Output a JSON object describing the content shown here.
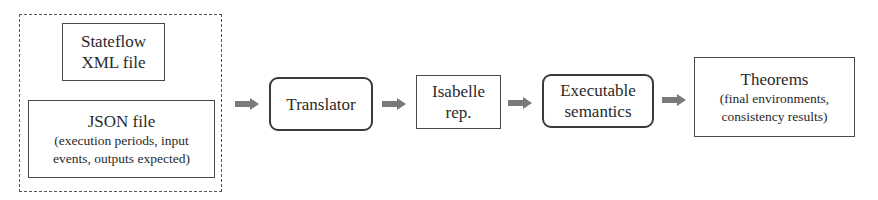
{
  "inputs_group": {
    "stateflow": {
      "line1": "Stateflow",
      "line2": "XML file"
    },
    "json": {
      "title": "JSON file",
      "line1": "(execution periods, input",
      "line2": "events, outputs expected)"
    }
  },
  "translator": {
    "label": "Translator"
  },
  "isabelle": {
    "line1": "Isabelle",
    "line2": "rep."
  },
  "executable": {
    "line1": "Executable",
    "line2": "semantics"
  },
  "theorems": {
    "title": "Theorems",
    "line1": "(final environments,",
    "line2": "consistency results)"
  },
  "colors": {
    "arrow": "#7a7a7a",
    "border": "#4a4a4a"
  },
  "icons": {
    "arrow": "right-block-arrow-icon"
  }
}
